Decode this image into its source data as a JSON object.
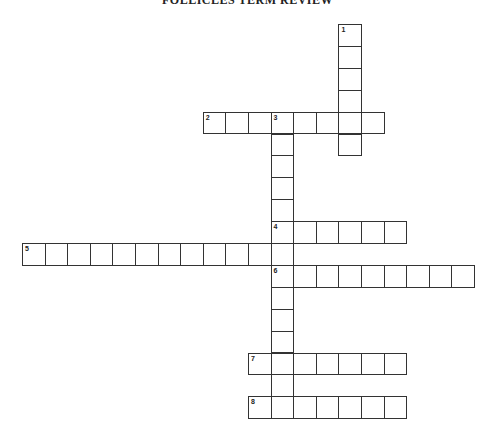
{
  "title": "FOLLICLES TERM REVIEW",
  "layout": {
    "origin_x": 22,
    "origin_y": 24,
    "cell_w": 22.6,
    "cell_h": 21.9
  },
  "colors": {
    "line": "#333333",
    "background": "#ffffff"
  },
  "entries": [
    {
      "number": "1",
      "direction": "down",
      "row": 0,
      "col": 14,
      "length": 6
    },
    {
      "number": "2",
      "direction": "across",
      "row": 4,
      "col": 8,
      "length": 8
    },
    {
      "number": "3",
      "direction": "down",
      "row": 4,
      "col": 11,
      "length": 14
    },
    {
      "number": "4",
      "direction": "across",
      "row": 9,
      "col": 11,
      "length": 6
    },
    {
      "number": "5",
      "direction": "across",
      "row": 10,
      "col": 0,
      "length": 12
    },
    {
      "number": "6",
      "direction": "across",
      "row": 11,
      "col": 11,
      "length": 9
    },
    {
      "number": "7",
      "direction": "across",
      "row": 15,
      "col": 10,
      "length": 7
    },
    {
      "number": "8",
      "direction": "across",
      "row": 17,
      "col": 10,
      "length": 7
    }
  ]
}
